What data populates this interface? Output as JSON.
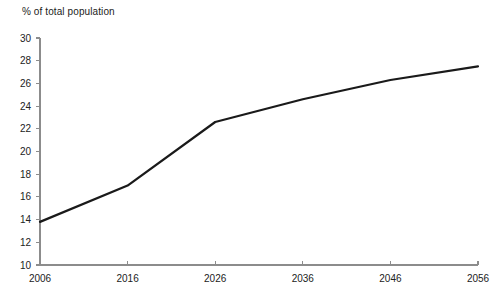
{
  "chart_data": {
    "type": "line",
    "title": "",
    "ylabel": "% of total population",
    "xlabel": "",
    "x": [
      2006,
      2016,
      2026,
      2036,
      2046,
      2056
    ],
    "categories": [
      "2006",
      "2016",
      "2026",
      "2036",
      "2046",
      "2056"
    ],
    "values": [
      13.8,
      17.0,
      22.6,
      24.6,
      26.3,
      27.5
    ],
    "series": [
      {
        "name": "% of total population",
        "values": [
          13.8,
          17.0,
          22.6,
          24.6,
          26.3,
          27.5
        ]
      }
    ],
    "ylim": [
      10,
      30
    ],
    "xlim": [
      2006,
      2056
    ],
    "yticks": [
      10,
      12,
      14,
      16,
      18,
      20,
      22,
      24,
      26,
      28,
      30
    ],
    "ytick_labels": [
      "10",
      "12",
      "14",
      "16",
      "18",
      "20",
      "22",
      "24",
      "26",
      "28",
      "30"
    ],
    "xticks": [
      2006,
      2016,
      2026,
      2036,
      2046,
      2056
    ],
    "xtick_labels": [
      "2006",
      "2016",
      "2026",
      "2036",
      "2046",
      "2056"
    ],
    "grid": false,
    "legend": "none",
    "line_color": "#1a1a1a",
    "axis_color": "#8c8c8c",
    "background": "#ffffff"
  }
}
